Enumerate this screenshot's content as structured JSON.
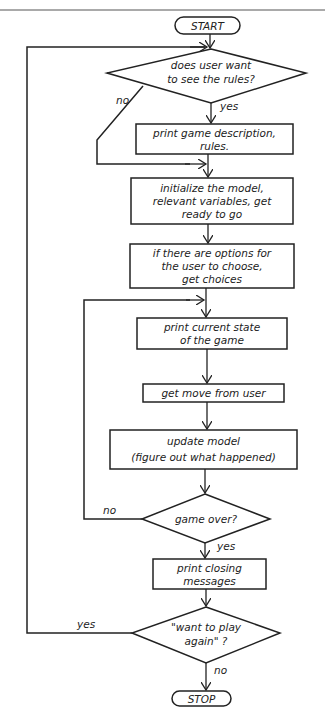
{
  "diagram": {
    "type": "flowchart",
    "terminals": {
      "start": "START",
      "stop": "STOP"
    },
    "steps": [
      {
        "id": "print_rules",
        "lines": [
          "print game description,",
          "rules."
        ]
      },
      {
        "id": "initialize",
        "lines": [
          "initialize the model,",
          "relevant variables, get",
          "ready to go"
        ]
      },
      {
        "id": "get_options",
        "lines": [
          "if there are options for",
          "the user to choose,",
          "get choices"
        ]
      },
      {
        "id": "print_state",
        "lines": [
          "print current state",
          "of the game"
        ]
      },
      {
        "id": "get_move",
        "lines": [
          "get move from user"
        ]
      },
      {
        "id": "update_model",
        "lines": [
          "update model",
          "(figure out what happened)"
        ]
      },
      {
        "id": "closing",
        "lines": [
          "print closing",
          "messages"
        ]
      }
    ],
    "decisions": [
      {
        "id": "see_rules",
        "lines": [
          "does user want",
          "to see the rules?"
        ],
        "yes": "yes",
        "no": "no"
      },
      {
        "id": "game_over",
        "lines": [
          "game over?"
        ],
        "yes": "yes",
        "no": "no"
      },
      {
        "id": "play_again",
        "lines": [
          "\"want to play",
          "again\" ?"
        ],
        "yes": "yes",
        "no": "no"
      }
    ]
  }
}
